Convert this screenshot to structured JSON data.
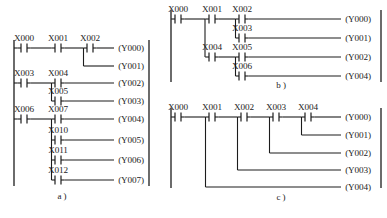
{
  "figure": {
    "type": "plc-ladder-logic-diagram",
    "panel_count": 3,
    "line_color": "#1c1c1c",
    "background_color": "#ffffff"
  },
  "panels": [
    {
      "id": "a",
      "caption": "a )",
      "caption_x": 62,
      "caption_y": 199,
      "left_rail_x": 14,
      "right_rail_x": 149,
      "rail_top": 40,
      "rail_bottom": 186,
      "contacts": [
        {
          "label": "X000",
          "x": 24,
          "y": 48
        },
        {
          "label": "X001",
          "x": 58,
          "y": 48
        },
        {
          "label": "X002",
          "x": 90,
          "y": 48
        },
        {
          "label": "X003",
          "x": 24,
          "y": 83
        },
        {
          "label": "X004",
          "x": 58,
          "y": 83
        },
        {
          "label": "X005",
          "x": 58,
          "y": 101
        },
        {
          "label": "X006",
          "x": 24,
          "y": 119
        },
        {
          "label": "X007",
          "x": 58,
          "y": 119
        },
        {
          "label": "X010",
          "x": 58,
          "y": 140
        },
        {
          "label": "X011",
          "x": 58,
          "y": 160
        },
        {
          "label": "X012",
          "x": 58,
          "y": 180
        }
      ],
      "coils": [
        {
          "label": "(Y000)",
          "x": 131,
          "y": 48
        },
        {
          "label": "(Y001)",
          "x": 131,
          "y": 66
        },
        {
          "label": "(Y002)",
          "x": 131,
          "y": 83
        },
        {
          "label": "(Y003)",
          "x": 131,
          "y": 101
        },
        {
          "label": "(Y004)",
          "x": 131,
          "y": 119
        },
        {
          "label": "(Y005)",
          "x": 131,
          "y": 140
        },
        {
          "label": "(Y006)",
          "x": 131,
          "y": 160
        },
        {
          "label": "(Y007)",
          "x": 131,
          "y": 180
        }
      ]
    },
    {
      "id": "b",
      "caption": "b )",
      "caption_x": 281,
      "caption_y": 88,
      "left_rail_x": 171,
      "right_rail_x": 381,
      "rail_top": 10,
      "rail_bottom": 82,
      "contacts": [
        {
          "label": "X000",
          "x": 178,
          "y": 19
        },
        {
          "label": "X001",
          "x": 212,
          "y": 19
        },
        {
          "label": "X002",
          "x": 242,
          "y": 19
        },
        {
          "label": "X003",
          "x": 242,
          "y": 38
        },
        {
          "label": "X004",
          "x": 212,
          "y": 57
        },
        {
          "label": "X005",
          "x": 242,
          "y": 57
        },
        {
          "label": "X006",
          "x": 242,
          "y": 76
        }
      ],
      "coils": [
        {
          "label": "(Y000)",
          "x": 358,
          "y": 19
        },
        {
          "label": "(Y001)",
          "x": 358,
          "y": 38
        },
        {
          "label": "(Y002)",
          "x": 358,
          "y": 57
        },
        {
          "label": "(Y004)",
          "x": 358,
          "y": 76
        }
      ]
    },
    {
      "id": "c",
      "caption": "c )",
      "caption_x": 281,
      "caption_y": 200,
      "left_rail_x": 171,
      "right_rail_x": 381,
      "rail_top": 108,
      "rail_bottom": 188,
      "contacts": [
        {
          "label": "X000",
          "x": 178,
          "y": 117
        },
        {
          "label": "X001",
          "x": 212,
          "y": 117
        },
        {
          "label": "X002",
          "x": 244,
          "y": 117
        },
        {
          "label": "X003",
          "x": 276,
          "y": 117
        },
        {
          "label": "X004",
          "x": 308,
          "y": 117
        }
      ],
      "coils": [
        {
          "label": "(Y000)",
          "x": 358,
          "y": 117
        },
        {
          "label": "(Y001)",
          "x": 358,
          "y": 135
        },
        {
          "label": "(Y002)",
          "x": 358,
          "y": 153
        },
        {
          "label": "(Y003)",
          "x": 358,
          "y": 170
        },
        {
          "label": "(Y004)",
          "x": 358,
          "y": 187
        }
      ]
    }
  ],
  "all_input_labels": [
    "X000",
    "X001",
    "X002",
    "X003",
    "X004",
    "X005",
    "X006",
    "X007",
    "X010",
    "X011",
    "X012"
  ],
  "all_output_labels": [
    "Y000",
    "Y001",
    "Y002",
    "Y003",
    "Y004",
    "Y005",
    "Y006",
    "Y007"
  ],
  "captions": [
    "a )",
    "b )",
    "c )"
  ]
}
